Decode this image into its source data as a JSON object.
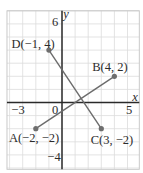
{
  "diagram": {
    "type": "coordinate-plane",
    "axes": {
      "x_label": "x",
      "y_label": "y",
      "tick_labels": [
        {
          "axis": "x",
          "value": -3,
          "text": "−3"
        },
        {
          "axis": "origin",
          "value": 0,
          "text": "0"
        },
        {
          "axis": "x",
          "value": 5,
          "text": "5"
        },
        {
          "axis": "y",
          "value": 6,
          "text": "6"
        },
        {
          "axis": "y",
          "value": -4,
          "text": "−4"
        }
      ]
    },
    "grid": {
      "x_min": -4.2,
      "x_max": 5.9,
      "y_min": -5.1,
      "y_max": 7.0,
      "step": 1
    },
    "points": [
      {
        "id": "A",
        "x": -2,
        "y": -2,
        "label": "A(−2, −2)"
      },
      {
        "id": "B",
        "x": 4,
        "y": 2,
        "label": "B(4, 2)"
      },
      {
        "id": "C",
        "x": 3,
        "y": -2,
        "label": "C(3, −2)"
      },
      {
        "id": "D",
        "x": -1,
        "y": 4,
        "label": "D(−1, 4)"
      }
    ],
    "segments": [
      {
        "from": "A",
        "to": "B"
      },
      {
        "from": "D",
        "to": "C"
      }
    ],
    "colors": {
      "axis": "#2a2a2a",
      "segment": "#6b6b6b",
      "point": "#6e6e6e",
      "grid": "#dcdcdc",
      "text": "#2b2b2b"
    }
  }
}
